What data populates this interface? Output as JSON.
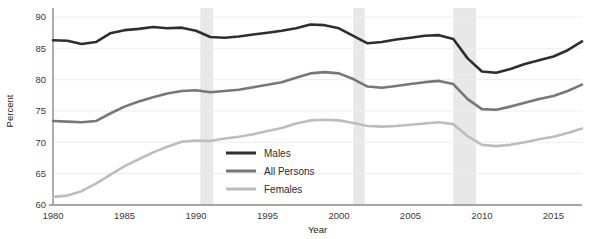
{
  "chart_data": {
    "type": "line",
    "title": "",
    "xlabel": "Year",
    "ylabel": "Percent",
    "xlim": [
      1980,
      2017
    ],
    "ylim": [
      60,
      90
    ],
    "yticks": [
      60,
      65,
      70,
      75,
      80,
      85,
      90
    ],
    "xticks": [
      1980,
      1985,
      1990,
      1995,
      2000,
      2005,
      2010,
      2015
    ],
    "grid": "horizontal",
    "legend_position": "center",
    "x": [
      1980,
      1981,
      1982,
      1983,
      1984,
      1985,
      1986,
      1987,
      1988,
      1989,
      1990,
      1991,
      1992,
      1993,
      1994,
      1995,
      1996,
      1997,
      1998,
      1999,
      2000,
      2001,
      2002,
      2003,
      2004,
      2005,
      2006,
      2007,
      2008,
      2009,
      2010,
      2011,
      2012,
      2013,
      2014,
      2015,
      2016,
      2017
    ],
    "series": [
      {
        "name": "Males",
        "color": "#2e2e2e",
        "values": [
          86.3,
          86.2,
          85.7,
          86.0,
          87.4,
          87.9,
          88.1,
          88.4,
          88.2,
          88.3,
          87.8,
          86.8,
          86.7,
          86.9,
          87.2,
          87.5,
          87.8,
          88.2,
          88.8,
          88.7,
          88.2,
          87.0,
          85.8,
          86.0,
          86.4,
          86.7,
          87.0,
          87.1,
          86.5,
          83.4,
          81.3,
          81.1,
          81.7,
          82.5,
          83.1,
          83.7,
          84.7,
          86.1
        ]
      },
      {
        "name": "All Persons",
        "color": "#777777",
        "values": [
          73.4,
          73.3,
          73.2,
          73.4,
          74.6,
          75.7,
          76.5,
          77.2,
          77.8,
          78.2,
          78.3,
          78.0,
          78.2,
          78.4,
          78.8,
          79.2,
          79.6,
          80.3,
          81.0,
          81.2,
          81.0,
          80.1,
          78.9,
          78.7,
          79.0,
          79.3,
          79.6,
          79.8,
          79.3,
          76.9,
          75.3,
          75.2,
          75.7,
          76.3,
          76.9,
          77.4,
          78.2,
          79.2
        ]
      },
      {
        "name": "Females",
        "color": "#bdbdbd",
        "values": [
          61.3,
          61.5,
          62.2,
          63.4,
          64.8,
          66.2,
          67.3,
          68.4,
          69.3,
          70.1,
          70.3,
          70.2,
          70.6,
          70.9,
          71.3,
          71.8,
          72.3,
          73.0,
          73.5,
          73.6,
          73.5,
          73.1,
          72.6,
          72.5,
          72.6,
          72.8,
          73.0,
          73.2,
          72.9,
          71.0,
          69.6,
          69.4,
          69.6,
          70.0,
          70.5,
          70.9,
          71.5,
          72.2
        ]
      }
    ],
    "shaded_bands": [
      {
        "start": 1990.3,
        "end": 1991.2,
        "color": "#e8e8e8"
      },
      {
        "start": 2001.0,
        "end": 2001.8,
        "color": "#e8e8e8"
      },
      {
        "start": 2008.0,
        "end": 2009.6,
        "color": "#e8e8e8"
      }
    ],
    "legend": [
      {
        "label": "Males",
        "color": "#2e2e2e"
      },
      {
        "label": "All Persons",
        "color": "#777777"
      },
      {
        "label": "Females",
        "color": "#bdbdbd"
      }
    ],
    "axis_color": "#8a8a8a",
    "grid_color": "#ededed"
  }
}
